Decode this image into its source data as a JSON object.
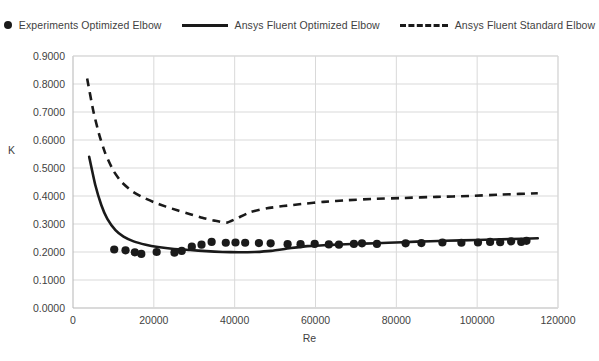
{
  "legend": {
    "position": "top",
    "items": [
      {
        "label": "Experiments Optimized Elbow",
        "marker": "dot-marker-icon"
      },
      {
        "label": "Ansys Fluent Optimized Elbow",
        "marker": "solid-line-icon"
      },
      {
        "label": "Ansys Fluent Standard Elbow",
        "marker": "dashed-line-icon"
      }
    ]
  },
  "axes": {
    "x_title": "Re",
    "y_title": "K",
    "x_ticks": [
      "0",
      "20000",
      "40000",
      "60000",
      "80000",
      "100000",
      "120000"
    ],
    "y_ticks": [
      "0.0000",
      "0.1000",
      "0.2000",
      "0.3000",
      "0.4000",
      "0.5000",
      "0.6000",
      "0.7000",
      "0.8000",
      "0.9000"
    ]
  },
  "chart_data": {
    "type": "line",
    "title": "",
    "xlabel": "Re",
    "ylabel": "K",
    "xlim": [
      0,
      120000
    ],
    "ylim": [
      0.0,
      0.9
    ],
    "grid": true,
    "legend_position": "top",
    "series": [
      {
        "name": "Experiments Optimized Elbow",
        "type": "scatter",
        "color": "#1a1a1a",
        "points": [
          [
            10200,
            0.209
          ],
          [
            13000,
            0.206
          ],
          [
            15300,
            0.199
          ],
          [
            16900,
            0.193
          ],
          [
            20700,
            0.2
          ],
          [
            25100,
            0.198
          ],
          [
            26900,
            0.204
          ],
          [
            29400,
            0.219
          ],
          [
            31800,
            0.226
          ],
          [
            34300,
            0.236
          ],
          [
            37800,
            0.233
          ],
          [
            40200,
            0.234
          ],
          [
            42600,
            0.233
          ],
          [
            46000,
            0.232
          ],
          [
            48900,
            0.231
          ],
          [
            53100,
            0.228
          ],
          [
            56300,
            0.228
          ],
          [
            59800,
            0.229
          ],
          [
            63300,
            0.227
          ],
          [
            65800,
            0.226
          ],
          [
            69500,
            0.229
          ],
          [
            71500,
            0.231
          ],
          [
            75200,
            0.229
          ],
          [
            82300,
            0.231
          ],
          [
            86200,
            0.232
          ],
          [
            91400,
            0.234
          ],
          [
            96100,
            0.233
          ],
          [
            100200,
            0.234
          ],
          [
            103200,
            0.236
          ],
          [
            105700,
            0.235
          ],
          [
            108400,
            0.238
          ],
          [
            110900,
            0.236
          ],
          [
            112200,
            0.24
          ]
        ]
      },
      {
        "name": "Ansys Fluent Optimized Elbow",
        "type": "line",
        "style": "solid",
        "color": "#1a1a1a",
        "points": [
          [
            4000,
            0.54
          ],
          [
            5500,
            0.44
          ],
          [
            7000,
            0.368
          ],
          [
            8500,
            0.318
          ],
          [
            10500,
            0.278
          ],
          [
            12500,
            0.255
          ],
          [
            15000,
            0.238
          ],
          [
            18000,
            0.226
          ],
          [
            21000,
            0.218
          ],
          [
            25000,
            0.211
          ],
          [
            29000,
            0.207
          ],
          [
            33000,
            0.203
          ],
          [
            37000,
            0.2
          ],
          [
            41000,
            0.199
          ],
          [
            45000,
            0.2
          ],
          [
            49000,
            0.204
          ],
          [
            54000,
            0.214
          ],
          [
            58000,
            0.221
          ],
          [
            62000,
            0.224
          ],
          [
            66000,
            0.227
          ],
          [
            72000,
            0.23
          ],
          [
            78000,
            0.233
          ],
          [
            85000,
            0.237
          ],
          [
            92000,
            0.24
          ],
          [
            100000,
            0.243
          ],
          [
            108000,
            0.246
          ],
          [
            115000,
            0.249
          ]
        ]
      },
      {
        "name": "Ansys Fluent Standard Elbow",
        "type": "line",
        "style": "dashed",
        "color": "#1a1a1a",
        "points": [
          [
            3500,
            0.82
          ],
          [
            5000,
            0.705
          ],
          [
            6500,
            0.618
          ],
          [
            8000,
            0.552
          ],
          [
            10000,
            0.49
          ],
          [
            12000,
            0.45
          ],
          [
            14500,
            0.418
          ],
          [
            17000,
            0.397
          ],
          [
            20000,
            0.378
          ],
          [
            23000,
            0.362
          ],
          [
            26000,
            0.348
          ],
          [
            29000,
            0.335
          ],
          [
            32000,
            0.322
          ],
          [
            35000,
            0.312
          ],
          [
            38000,
            0.305
          ],
          [
            40500,
            0.32
          ],
          [
            44000,
            0.343
          ],
          [
            48000,
            0.356
          ],
          [
            52000,
            0.364
          ],
          [
            57000,
            0.372
          ],
          [
            62000,
            0.379
          ],
          [
            68000,
            0.385
          ],
          [
            75000,
            0.39
          ],
          [
            82000,
            0.393
          ],
          [
            90000,
            0.397
          ],
          [
            98000,
            0.4
          ],
          [
            106000,
            0.405
          ],
          [
            115000,
            0.41
          ]
        ]
      }
    ]
  }
}
